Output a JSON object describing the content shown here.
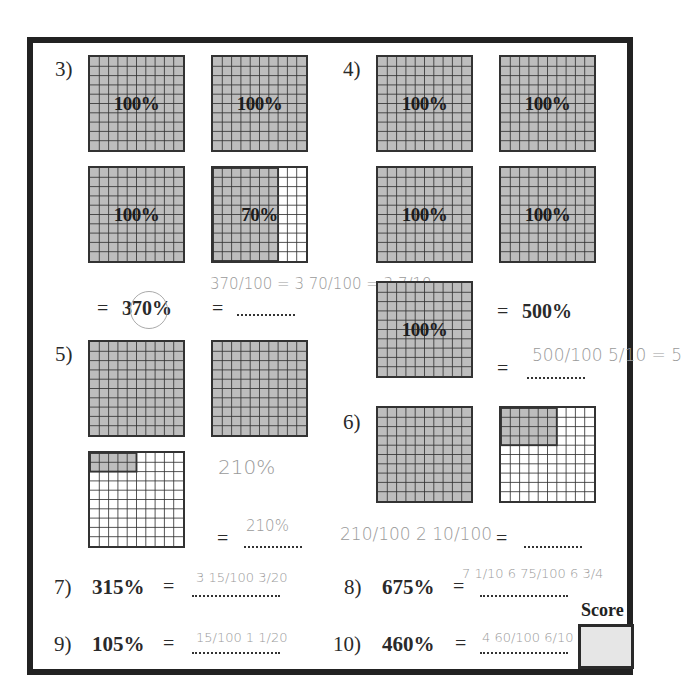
{
  "worksheet": {
    "problems": [
      {
        "number": "3)",
        "grids": [
          {
            "shaded_percent": 100,
            "label": "100%"
          },
          {
            "shaded_percent": 100,
            "label": "100%"
          },
          {
            "shaded_percent": 100,
            "label": "100%"
          },
          {
            "shaded_percent": 70,
            "label": "70%"
          }
        ],
        "given_percent": "370%",
        "equals": "=",
        "answer_handwritten": "370/100 = 3 70/100 = 3 7/10"
      },
      {
        "number": "4)",
        "grids": [
          {
            "shaded_percent": 100,
            "label": "100%"
          },
          {
            "shaded_percent": 100,
            "label": "100%"
          },
          {
            "shaded_percent": 100,
            "label": "100%"
          },
          {
            "shaded_percent": 100,
            "label": "100%"
          },
          {
            "shaded_percent": 100,
            "label": "100%"
          }
        ],
        "given_percent": "500%",
        "equals": "=",
        "answer_handwritten": "500/100 5/10 = 5"
      },
      {
        "number": "5)",
        "grids": [
          {
            "shaded_percent": 100,
            "label": ""
          },
          {
            "shaded_percent": 100,
            "label": ""
          },
          {
            "shaded_percent": 10,
            "label": ""
          }
        ],
        "equals": "=",
        "note_handwritten": "210%",
        "answer_handwritten": "210%"
      },
      {
        "number": "6)",
        "grids": [
          {
            "shaded_percent": 100,
            "label": ""
          },
          {
            "shaded_percent": 24,
            "label": ""
          }
        ],
        "equals": "=",
        "work_handwritten": "210/100  2 10/100",
        "answer_handwritten": ""
      }
    ],
    "conversions": [
      {
        "number": "7)",
        "percent": "315%",
        "equals": "=",
        "answer_handwritten": "3 15/100  3/20"
      },
      {
        "number": "8)",
        "percent": "675%",
        "equals": "=",
        "answer_handwritten": "7 1/10  6 75/100  6 3/4"
      },
      {
        "number": "9)",
        "percent": "105%",
        "equals": "=",
        "answer_handwritten": "15/100  1 1/20"
      },
      {
        "number": "10)",
        "percent": "460%",
        "equals": "=",
        "answer_handwritten": "4 60/100  6/10"
      }
    ],
    "score": {
      "label": "Score",
      "value": ""
    }
  },
  "colors": {
    "shade": "#bdbdbd",
    "grid_line": "#333333",
    "border": "#222222",
    "pencil": "#9a9a9a"
  }
}
